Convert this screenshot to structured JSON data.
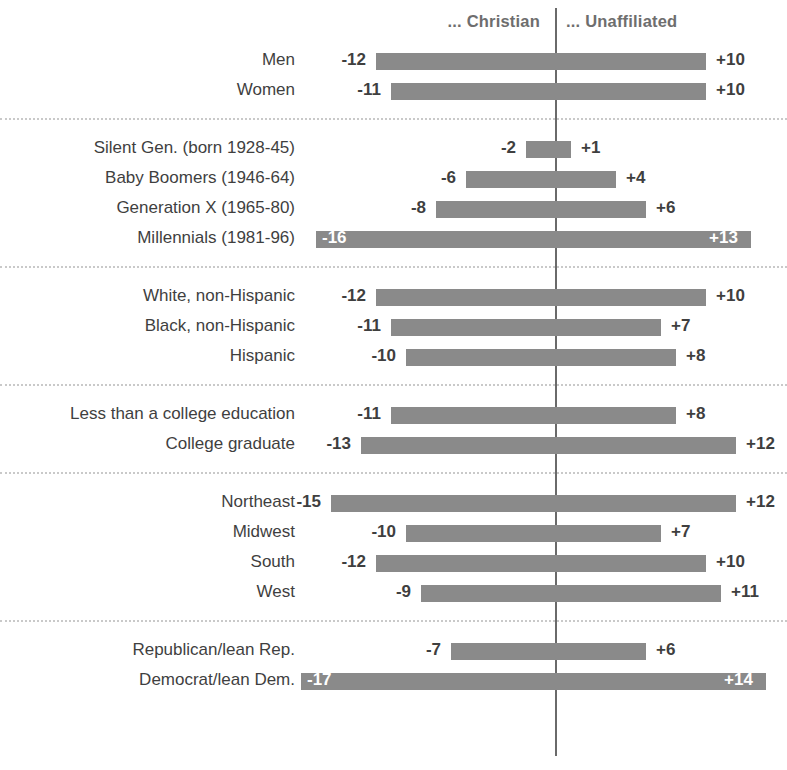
{
  "legend": {
    "left_label": "... Christian",
    "right_label": "... Unaffiliated"
  },
  "colors": {
    "bar": "#8a8a8a",
    "axis": "#6a6a6a",
    "text": "#3f3f3f",
    "legend_text": "#6e6e6e",
    "divider": "#c9c9c9",
    "inside_label": "#ffffff"
  },
  "chart_data": {
    "type": "bar",
    "title": "",
    "subtitle": "",
    "xlabel": "",
    "ylabel": "",
    "orientation": "horizontal",
    "layout": "diverging",
    "grid": false,
    "legend_position": "top",
    "xlim": [
      -18,
      15
    ],
    "units_per_point": 15,
    "series": [
      {
        "name": "... Christian",
        "side": "left"
      },
      {
        "name": "... Unaffiliated",
        "side": "right"
      }
    ],
    "groups": [
      {
        "name": "Gender",
        "rows": [
          {
            "category": "Men",
            "christian": -12,
            "unaffiliated": 10,
            "christian_label": "-12",
            "unaffiliated_label": "+10",
            "labels_inside": false
          },
          {
            "category": "Women",
            "christian": -11,
            "unaffiliated": 10,
            "christian_label": "-11",
            "unaffiliated_label": "+10",
            "labels_inside": false
          }
        ]
      },
      {
        "name": "Generation",
        "rows": [
          {
            "category": "Silent Gen. (born 1928-45)",
            "christian": -2,
            "unaffiliated": 1,
            "christian_label": "-2",
            "unaffiliated_label": "+1",
            "labels_inside": false
          },
          {
            "category": "Baby Boomers (1946-64)",
            "christian": -6,
            "unaffiliated": 4,
            "christian_label": "-6",
            "unaffiliated_label": "+4",
            "labels_inside": false
          },
          {
            "category": "Generation X (1965-80)",
            "christian": -8,
            "unaffiliated": 6,
            "christian_label": "-8",
            "unaffiliated_label": "+6",
            "labels_inside": false
          },
          {
            "category": "Millennials (1981-96)",
            "christian": -16,
            "unaffiliated": 13,
            "christian_label": "-16",
            "unaffiliated_label": "+13",
            "labels_inside": true
          }
        ]
      },
      {
        "name": "Race and ethnicity",
        "rows": [
          {
            "category": "White, non-Hispanic",
            "christian": -12,
            "unaffiliated": 10,
            "christian_label": "-12",
            "unaffiliated_label": "+10",
            "labels_inside": false
          },
          {
            "category": "Black, non-Hispanic",
            "christian": -11,
            "unaffiliated": 7,
            "christian_label": "-11",
            "unaffiliated_label": "+7",
            "labels_inside": false
          },
          {
            "category": "Hispanic",
            "christian": -10,
            "unaffiliated": 8,
            "christian_label": "-10",
            "unaffiliated_label": "+8",
            "labels_inside": false
          }
        ]
      },
      {
        "name": "Education",
        "rows": [
          {
            "category": "Less than a college education",
            "christian": -11,
            "unaffiliated": 8,
            "christian_label": "-11",
            "unaffiliated_label": "+8",
            "labels_inside": false
          },
          {
            "category": "College graduate",
            "christian": -13,
            "unaffiliated": 12,
            "christian_label": "-13",
            "unaffiliated_label": "+12",
            "labels_inside": false
          }
        ]
      },
      {
        "name": "Region",
        "rows": [
          {
            "category": "Northeast",
            "christian": -15,
            "unaffiliated": 12,
            "christian_label": "-15",
            "unaffiliated_label": "+12",
            "labels_inside": false
          },
          {
            "category": "Midwest",
            "christian": -10,
            "unaffiliated": 7,
            "christian_label": "-10",
            "unaffiliated_label": "+7",
            "labels_inside": false
          },
          {
            "category": "South",
            "christian": -12,
            "unaffiliated": 10,
            "christian_label": "-12",
            "unaffiliated_label": "+10",
            "labels_inside": false
          },
          {
            "category": "West",
            "christian": -9,
            "unaffiliated": 11,
            "christian_label": "-9",
            "unaffiliated_label": "+11",
            "labels_inside": false
          }
        ]
      },
      {
        "name": "Party",
        "rows": [
          {
            "category": "Republican/lean Rep.",
            "christian": -7,
            "unaffiliated": 6,
            "christian_label": "-7",
            "unaffiliated_label": "+6",
            "labels_inside": false
          },
          {
            "category": "Democrat/lean Dem.",
            "christian": -17,
            "unaffiliated": 14,
            "christian_label": "-17",
            "unaffiliated_label": "+14",
            "labels_inside": true
          }
        ]
      }
    ]
  }
}
